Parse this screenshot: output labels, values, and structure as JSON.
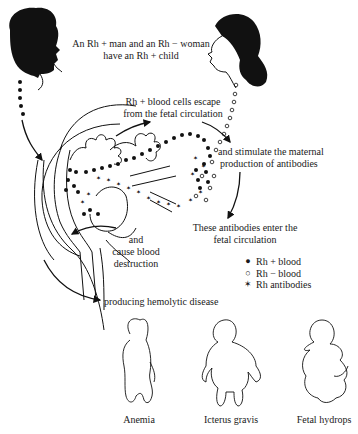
{
  "diagram": {
    "labels": {
      "parents": [
        "An Rh + man and an Rh − woman",
        "have an Rh + child"
      ],
      "escape": [
        "Rh + blood cells escape",
        "from the fetal circulation"
      ],
      "stimulate": [
        "and stimulate the maternal",
        "production of antibodies"
      ],
      "enter": [
        "These antibodies enter the",
        "fetal circulation"
      ],
      "destruction": [
        "and",
        "cause blood",
        "destruction"
      ],
      "disease": "producing hemolytic disease"
    },
    "legend": [
      {
        "symbol": "●",
        "icon": "filled-dot-icon",
        "label": "Rh + blood"
      },
      {
        "symbol": "○",
        "icon": "open-dot-icon",
        "label": "Rh − blood"
      },
      {
        "symbol": "✶",
        "icon": "antibody-icon",
        "label": "Rh antibodies"
      }
    ],
    "outcomes": [
      "Anemia",
      "Icterus gravis",
      "Fetal hydrops"
    ],
    "colors": {
      "ink": "#1a1a1a",
      "background": "#ffffff"
    }
  }
}
